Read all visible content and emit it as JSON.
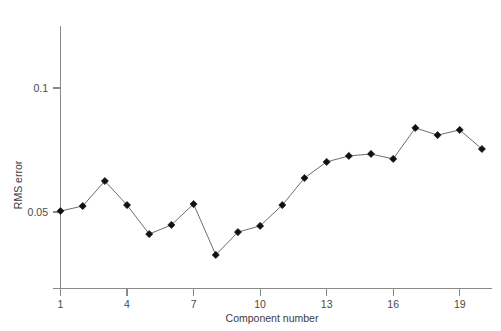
{
  "chart_data": {
    "type": "line",
    "title": "",
    "subtitle": "",
    "xlabel": "Component number",
    "ylabel": "RMS error",
    "x": [
      1,
      2,
      3,
      4,
      5,
      6,
      7,
      8,
      9,
      10,
      11,
      12,
      13,
      14,
      15,
      16,
      17,
      18,
      19,
      20
    ],
    "values": [
      0.0504,
      0.0524,
      0.0625,
      0.0528,
      0.0411,
      0.0448,
      0.0532,
      0.0327,
      0.0419,
      0.0444,
      0.0528,
      0.0637,
      0.0702,
      0.0726,
      0.0734,
      0.0714,
      0.0839,
      0.081,
      0.0831,
      0.0754
    ],
    "series": [
      {
        "name": "RMS error",
        "values": [
          0.0504,
          0.0524,
          0.0625,
          0.0528,
          0.0411,
          0.0448,
          0.0532,
          0.0327,
          0.0419,
          0.0444,
          0.0528,
          0.0637,
          0.0702,
          0.0726,
          0.0734,
          0.0714,
          0.0839,
          0.081,
          0.0831,
          0.0754
        ],
        "marker": "diamond",
        "marker_color": "#111111",
        "line_color": "#6e6e6e"
      }
    ],
    "xticks": [
      1,
      4,
      7,
      10,
      13,
      16,
      19
    ],
    "xtick_labels": [
      "1",
      "4",
      "7",
      "10",
      "13",
      "16",
      "19"
    ],
    "yticks": [
      0.05,
      0.1
    ],
    "ytick_labels": [
      "0.05",
      "0.1"
    ],
    "xlim": [
      0.55,
      20.45
    ],
    "ylim": [
      0.0235,
      0.1125
    ],
    "grid": false,
    "legend": null,
    "legend_position": "none",
    "annotations": []
  },
  "axes": {
    "x_axis_name": "component-number-axis",
    "y_axis_name": "rms-error-axis"
  }
}
